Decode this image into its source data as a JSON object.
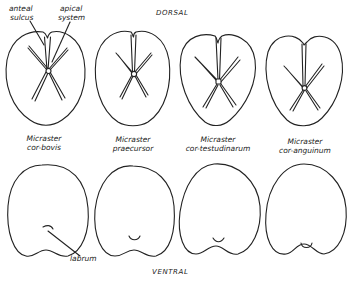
{
  "figure": {
    "view_labels": {
      "dorsal": "DORSAL",
      "ventral": "VENTRAL"
    },
    "annotations": {
      "anterior_sulcus_line1": "anteal",
      "anterior_sulcus_line2": "sulcus",
      "apical_system_line1": "apical",
      "apical_system_line2": "system",
      "labrum": "labrum"
    },
    "species": [
      {
        "genus": "Micraster",
        "species": "cor-bovis"
      },
      {
        "genus": "Micraster",
        "species": "praecursor"
      },
      {
        "genus": "Micraster",
        "species": "cor-testudinarum"
      },
      {
        "genus": "Micraster",
        "species": "cor-anguinum"
      }
    ],
    "colors": {
      "background": "#ffffff",
      "ink": "#222222"
    }
  }
}
